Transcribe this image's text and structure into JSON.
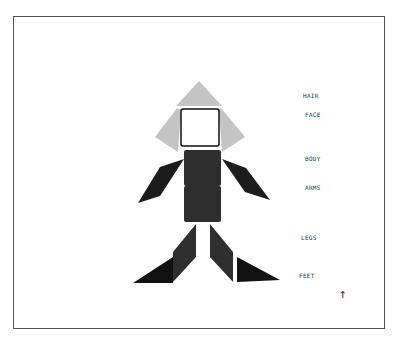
{
  "figure": {
    "colors": {
      "hair": "#c4c4c4",
      "face_fill": "#ffffff",
      "face_border": "#111111",
      "body": "#2e2e2e",
      "arms": "#1c1c1c",
      "legs": "#2e2e2e",
      "feet": "#111111",
      "frame": "#555555"
    }
  },
  "labels": {
    "hair": "HAIR",
    "face": "FACE",
    "body": "BODY",
    "arms": "ARMS",
    "legs": "LEGS",
    "feet": "FEET"
  },
  "arrow": "↑"
}
